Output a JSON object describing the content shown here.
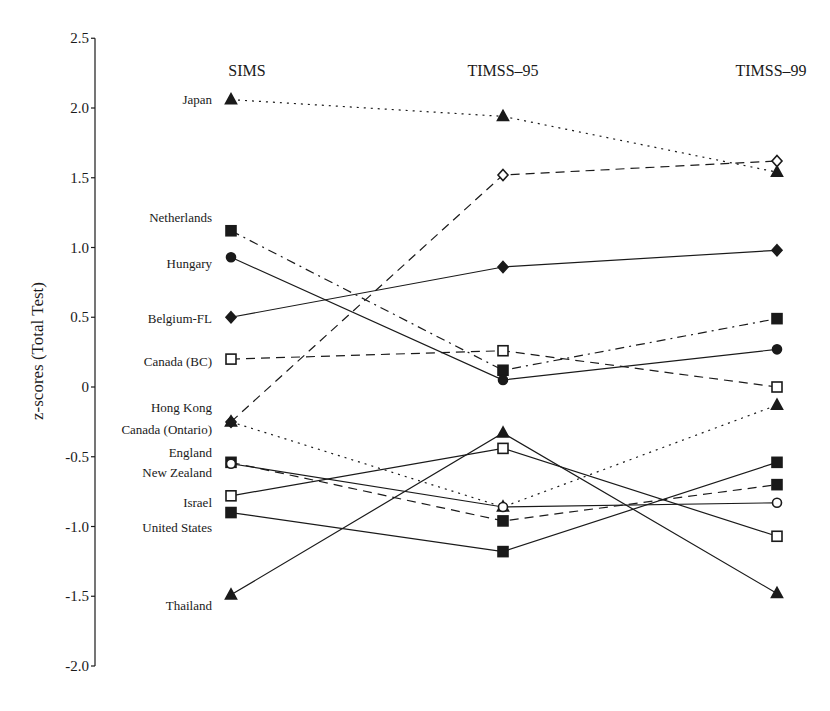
{
  "chart_data": {
    "type": "line",
    "title": "",
    "xlabel": "",
    "ylabel": "z-scores (Total Test)",
    "ylim": [
      -2.0,
      2.5
    ],
    "yticks": [
      2.5,
      2.0,
      1.5,
      1.0,
      0.5,
      0,
      -0.5,
      -1.0,
      -1.5,
      -2.0
    ],
    "ytick_labels": [
      "2.5",
      "2.0",
      "1.5",
      "1.0",
      "0.5",
      "0",
      "-0.5",
      "-1.0",
      "-1.5",
      "-2.0"
    ],
    "grid": false,
    "legend": "direct labels at left of SIMS column",
    "categories": [
      "SIMS",
      "TIMSS–95",
      "TIMSS–99"
    ],
    "series": [
      {
        "name": "Japan",
        "marker": "triangle-filled",
        "line": "dotted",
        "values": [
          2.06,
          1.94,
          1.54
        ]
      },
      {
        "name": "Netherlands",
        "marker": "square-filled",
        "line": "dashdot",
        "values": [
          1.12,
          0.12,
          0.49
        ]
      },
      {
        "name": "Hungary",
        "marker": "circle-filled",
        "line": "solid",
        "values": [
          0.93,
          0.05,
          0.27
        ]
      },
      {
        "name": "Belgium-FL",
        "marker": "diamond-filled",
        "line": "solid",
        "values": [
          0.5,
          0.86,
          0.98
        ]
      },
      {
        "name": "Canada (BC)",
        "marker": "square-open",
        "line": "dashed",
        "values": [
          0.2,
          0.26,
          0.0
        ]
      },
      {
        "name": "Hong Kong",
        "marker": "diamond-open",
        "line": "dashed",
        "values": [
          -0.25,
          1.52,
          1.62
        ]
      },
      {
        "name": "Canada (Ontario)",
        "marker": "triangle-filled",
        "line": "dotted",
        "values": [
          -0.25,
          -0.86,
          -0.13
        ]
      },
      {
        "name": "England",
        "marker": "square-filled",
        "line": "dashed",
        "values": [
          -0.54,
          -0.96,
          -0.7
        ]
      },
      {
        "name": "New Zealand",
        "marker": "circle-open",
        "line": "solid",
        "values": [
          -0.55,
          -0.86,
          -0.83
        ]
      },
      {
        "name": "Israel",
        "marker": "square-open",
        "line": "solid",
        "values": [
          -0.78,
          -0.44,
          -1.07
        ]
      },
      {
        "name": "United States",
        "marker": "square-filled",
        "line": "solid",
        "values": [
          -0.9,
          -1.18,
          -0.54
        ]
      },
      {
        "name": "Thailand",
        "marker": "triangle-filled",
        "line": "solid",
        "values": [
          -1.49,
          -0.33,
          -1.48
        ]
      }
    ],
    "labels": [
      {
        "text": "Japan",
        "value": 2.06
      },
      {
        "text": "Netherlands",
        "value": 1.21
      },
      {
        "text": "Hungary",
        "value": 0.88
      },
      {
        "text": "Belgium-FL",
        "value": 0.49
      },
      {
        "text": "Canada (BC)",
        "value": 0.18
      },
      {
        "text": "Hong Kong",
        "value": -0.15
      },
      {
        "text": "Canada (Ontario)",
        "value": -0.31
      },
      {
        "text": "England",
        "value": -0.47
      },
      {
        "text": "New Zealand",
        "value": -0.62
      },
      {
        "text": "Israel",
        "value": -0.83
      },
      {
        "text": "United States",
        "value": -1.01
      },
      {
        "text": "Thailand",
        "value": -1.57
      }
    ]
  },
  "colors": {
    "ink": "#1a1a1a",
    "background": "#ffffff"
  }
}
